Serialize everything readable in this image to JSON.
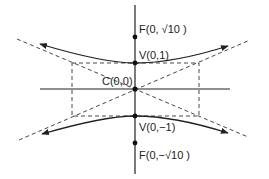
{
  "diagram": {
    "type": "hyperbola",
    "orientation": "vertical transverse axis",
    "colors": {
      "ink": "#222222",
      "background": "#ffffff"
    },
    "points": [
      {
        "id": "focus-top",
        "label": "F(0, √10 )",
        "name": "F",
        "coords": "0, √10"
      },
      {
        "id": "vertex-top",
        "label": "V(0,1)",
        "name": "V",
        "coords": "0,1"
      },
      {
        "id": "center",
        "label": "C(0,0)",
        "name": "C",
        "coords": "0,0"
      },
      {
        "id": "vertex-bottom",
        "label": "V(0,−1)",
        "name": "V",
        "coords": "0,−1"
      },
      {
        "id": "focus-bottom",
        "label": "F(0,−√10 )",
        "name": "F",
        "coords": "0,−√10"
      }
    ],
    "elements": [
      "vertical axis",
      "horizontal axis",
      "two branches with arrows",
      "dashed asymptotes",
      "dashed fundamental rectangle"
    ]
  }
}
